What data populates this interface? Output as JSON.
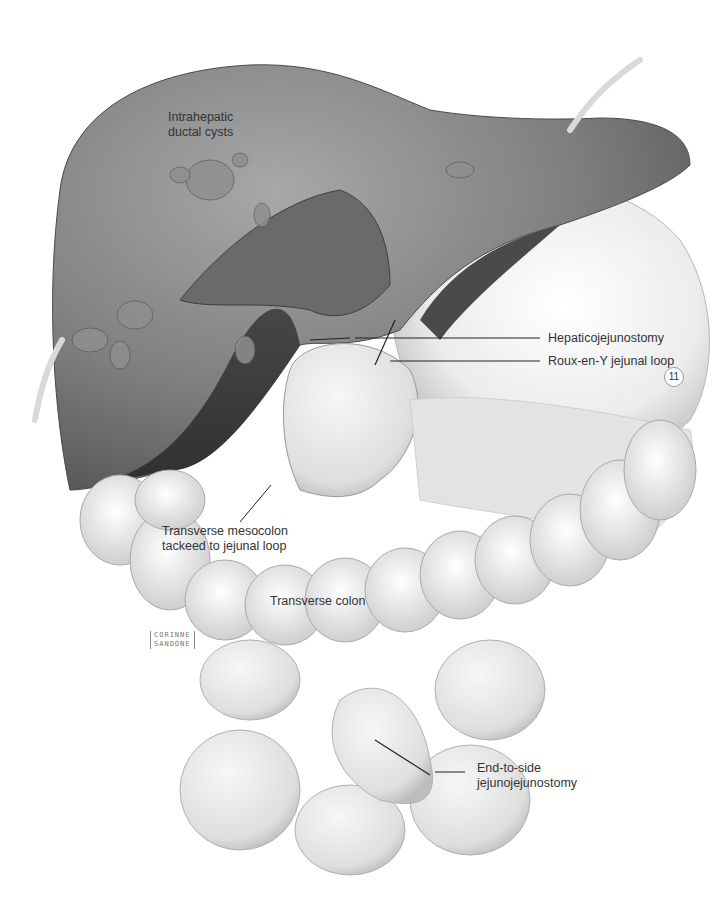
{
  "figure": {
    "number_badge": "11",
    "signature": [
      "CORINNE",
      "SANDONE"
    ],
    "labels": {
      "intrahepatic_cysts": [
        "Intrahepatic",
        "ductal cysts"
      ],
      "hepaticojejunostomy": "Hepaticojejunostomy",
      "roux_en_y": "Roux-en-Y jejunal loop",
      "mesocolon": [
        "Transverse mesocolon",
        "tackeed to jejunal loop"
      ],
      "transverse_colon": "Transverse colon",
      "jejunojejunostomy": [
        "End-to-side",
        "jejunojejunostomy"
      ]
    },
    "colors": {
      "liver_dark": "#5a5a5a",
      "liver_mid": "#8a8a8a",
      "organ_light": "#dcdcdc",
      "background": "#ffffff",
      "leader_line": "#222222",
      "label_text": "#333333"
    }
  }
}
